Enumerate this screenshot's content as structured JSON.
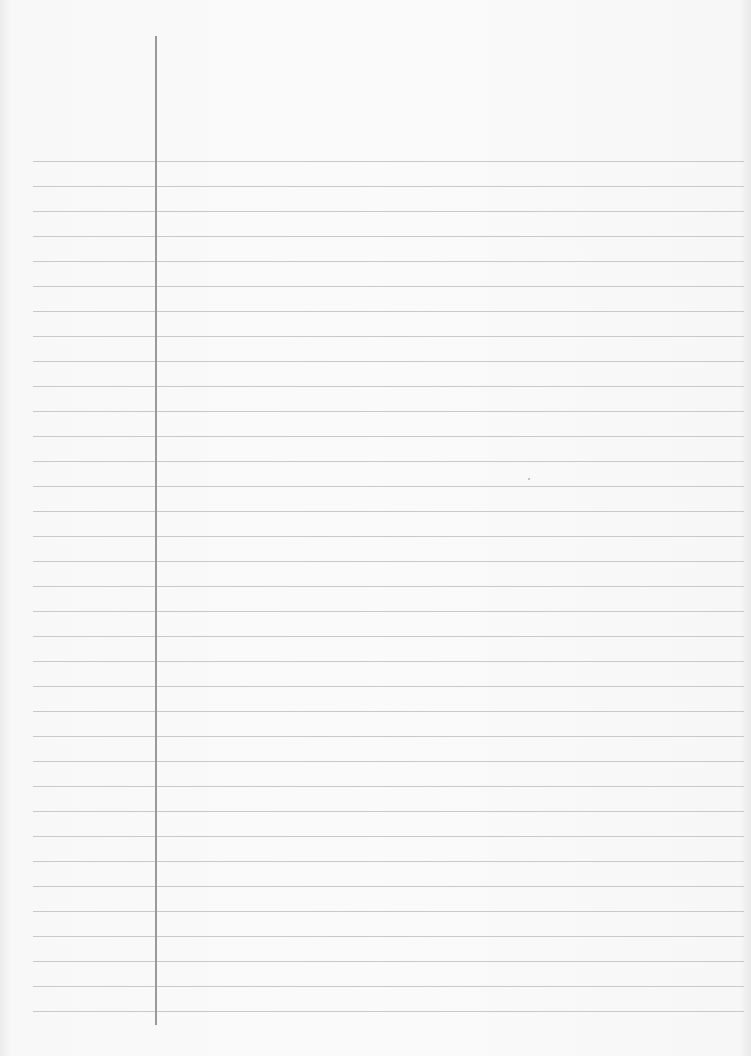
{
  "page": {
    "type": "lined-paper",
    "background_color": "#f8f8f8",
    "rule_color": "#c9c9c9",
    "margin_line_color": "#9a9a9a",
    "rule_count": 35,
    "first_rule_y": 161,
    "rule_spacing": 25,
    "rule_left": 33,
    "rule_right": 744,
    "margin_line_x": 155,
    "margin_line_top": 36,
    "margin_line_bottom": 1025
  }
}
